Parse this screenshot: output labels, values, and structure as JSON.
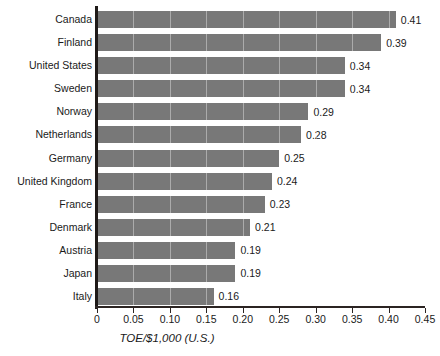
{
  "chart_data": {
    "type": "bar",
    "orientation": "horizontal",
    "title": "",
    "xlabel": "TOE/$1,000 (U.S.)",
    "ylabel": "",
    "xlim": [
      0,
      0.45
    ],
    "xticks": [
      "0",
      "0.05",
      "0.10",
      "0.15",
      "0.20",
      "0.25",
      "0.30",
      "0.35",
      "0.40",
      "0.45"
    ],
    "xtick_values": [
      0,
      0.05,
      0.1,
      0.15,
      0.2,
      0.25,
      0.3,
      0.35,
      0.4,
      0.45
    ],
    "grid": "vertical-light",
    "legend": "none",
    "bar_color": "#787878",
    "axis_color": "#1f1a18",
    "categories": [
      "Canada",
      "Finland",
      "United States",
      "Sweden",
      "Norway",
      "Netherlands",
      "Germany",
      "United Kingdom",
      "France",
      "Denmark",
      "Austria",
      "Japan",
      "Italy"
    ],
    "values": [
      0.41,
      0.39,
      0.34,
      0.34,
      0.29,
      0.28,
      0.25,
      0.24,
      0.23,
      0.21,
      0.19,
      0.19,
      0.16
    ],
    "value_labels": [
      "0.41",
      "0.39",
      "0.34",
      "0.34",
      "0.29",
      "0.28",
      "0.25",
      "0.24",
      "0.23",
      "0.21",
      "0.19",
      "0.19",
      "0.16"
    ]
  }
}
